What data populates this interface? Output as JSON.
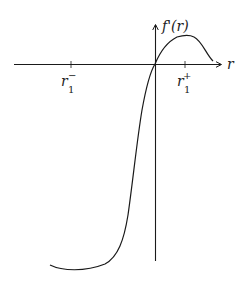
{
  "diagram": {
    "y_axis_label": "f'(r)",
    "x_axis_label": "r",
    "ticks": [
      {
        "label_base": "r",
        "label_sub": "1",
        "label_sup": "−",
        "position": "negative"
      },
      {
        "label_base": "r",
        "label_sub": "1",
        "label_sup": "+",
        "position": "positive"
      }
    ],
    "curve_description": "Increasing curve passing through origin: deep minimum at far left-bottom, rises steeply through origin, reaches a maximum near r1+, then decreases toward the axis",
    "colors": {
      "line": "#1a1a1a",
      "background": "#ffffff"
    }
  }
}
